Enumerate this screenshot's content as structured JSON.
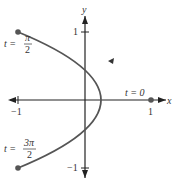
{
  "diagram": {
    "type": "parametric-curve",
    "axes": {
      "x_label": "x",
      "y_label": "y",
      "x_ticks": [
        {
          "value": -1,
          "label": "−1"
        },
        {
          "value": 1,
          "label": "1"
        }
      ],
      "y_ticks": [
        {
          "value": 1,
          "label": "1"
        },
        {
          "value": -1,
          "label": "−1"
        }
      ]
    },
    "annotations": {
      "t0": "t = 0",
      "t_pi_over_2": {
        "prefix": "t =",
        "num": "π",
        "den": "2"
      },
      "t_3pi_over_2": {
        "prefix": "t =",
        "num": "3π",
        "den": "2"
      }
    },
    "curve": {
      "description": "x = cos t, y = sin t... parabola-like arc from (-1,1) through (1,0) to (-1,-1)",
      "points": [
        [
          -1,
          1
        ],
        [
          1,
          0
        ],
        [
          -1,
          -1
        ]
      ],
      "direction": "from t=0 at (1,0) toward (-1,1)",
      "color": "#555555"
    },
    "colors": {
      "axis": "#222222",
      "curve": "#555555",
      "dot": "#555555"
    }
  }
}
